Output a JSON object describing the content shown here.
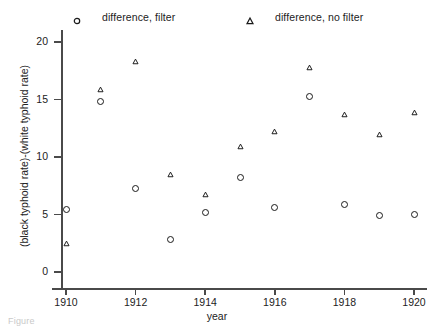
{
  "chart_data": {
    "type": "scatter",
    "title": "",
    "xlabel": "year",
    "ylabel": "(black typhoid rate)-(white typhoid rate)",
    "xlim": [
      1909.4,
      1920.6
    ],
    "ylim": [
      0,
      21.5
    ],
    "grid": false,
    "legend_position": "top",
    "x_ticks": [
      1910,
      1912,
      1914,
      1916,
      1918,
      1920
    ],
    "x_tick_labels": [
      "1910",
      "1912",
      "1914",
      "1916",
      "1918",
      "1920"
    ],
    "y_ticks": [
      0,
      5,
      10,
      15,
      20
    ],
    "y_tick_labels": [
      "0",
      "5",
      "10",
      "15",
      "20"
    ],
    "x": [
      1910,
      1911,
      1912,
      1913,
      1914,
      1915,
      1916,
      1917,
      1918,
      1919,
      1920
    ],
    "series": [
      {
        "name": "difference, filter",
        "marker": "circle-open",
        "color": "#1a1a1a",
        "values": [
          5.4,
          14.8,
          7.3,
          2.8,
          5.2,
          8.2,
          5.6,
          15.3,
          5.9,
          4.9,
          5.0
        ]
      },
      {
        "name": "difference, no filter",
        "marker": "triangle-open",
        "color": "#1a1a1a",
        "values": [
          2.5,
          15.9,
          18.3,
          8.5,
          6.7,
          10.9,
          12.2,
          17.8,
          13.7,
          12.0,
          13.9
        ]
      }
    ]
  },
  "legend": {
    "entries": [
      {
        "label": "difference, filter",
        "marker": "circle-open"
      },
      {
        "label": "difference, no filter",
        "marker": "triangle-open"
      }
    ]
  },
  "caption": {
    "text": "Figure"
  }
}
